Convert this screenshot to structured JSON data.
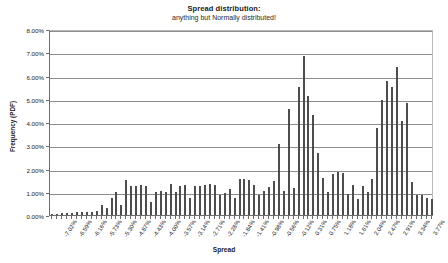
{
  "chart_data": {
    "type": "bar",
    "title": "Spread distribution:",
    "subtitle": "anything but Normally distributed!",
    "xlabel": "Spread",
    "ylabel": "Frequency (PDF)",
    "ylim": [
      0,
      8
    ],
    "ytick_labels": [
      "0.00%",
      "1.00%",
      "2.00%",
      "3.00%",
      "4.00%",
      "5.00%",
      "6.00%",
      "7.00%",
      "8.00%"
    ],
    "ytick_values": [
      0,
      1,
      2,
      3,
      4,
      5,
      6,
      7,
      8
    ],
    "grid": true,
    "legend": "none",
    "bar_color": "#4d4d4d",
    "xtick_labels": [
      "-7.02%",
      "-6.59%",
      "-6.16%",
      "-5.73%",
      "-5.30%",
      "-4.87%",
      "-4.43%",
      "-4.00%",
      "-3.57%",
      "-3.14%",
      "-2.71%",
      "-2.28%",
      "-1.84%",
      "-1.41%",
      "-0.98%",
      "-0.56%",
      "-0.12%",
      "0.31%",
      "0.75%",
      "1.18%",
      "1.61%",
      "2.04%",
      "2.47%",
      "2.91%",
      "3.34%",
      "3.77%"
    ],
    "xtick_bin_indices": [
      0,
      3,
      6,
      9,
      12,
      15,
      18,
      21,
      24,
      27,
      30,
      33,
      36,
      39,
      42,
      45,
      48,
      51,
      54,
      57,
      60,
      63,
      66,
      69,
      72,
      75
    ],
    "bin_count": 78,
    "values": [
      0.05,
      0.05,
      0.1,
      0.08,
      0.1,
      0.12,
      0.15,
      0.12,
      0.15,
      0.18,
      0.45,
      0.3,
      0.75,
      1.0,
      0.45,
      1.5,
      1.25,
      1.25,
      1.3,
      1.25,
      0.55,
      1.0,
      1.05,
      1.0,
      1.35,
      1.0,
      1.25,
      1.3,
      0.75,
      1.25,
      1.25,
      1.3,
      1.35,
      1.3,
      0.85,
      0.95,
      1.1,
      0.75,
      1.55,
      1.55,
      1.5,
      1.3,
      0.85,
      1.05,
      1.2,
      1.45,
      3.05,
      1.05,
      4.55,
      1.15,
      5.5,
      6.85,
      5.1,
      4.3,
      2.65,
      1.6,
      1.0,
      1.75,
      1.85,
      1.8,
      0.9,
      1.3,
      0.7,
      1.25,
      1.0,
      1.55,
      3.75,
      4.95,
      5.75,
      5.5,
      6.35,
      4.05,
      4.8,
      1.4,
      0.85,
      0.85,
      0.75,
      0.7
    ]
  }
}
